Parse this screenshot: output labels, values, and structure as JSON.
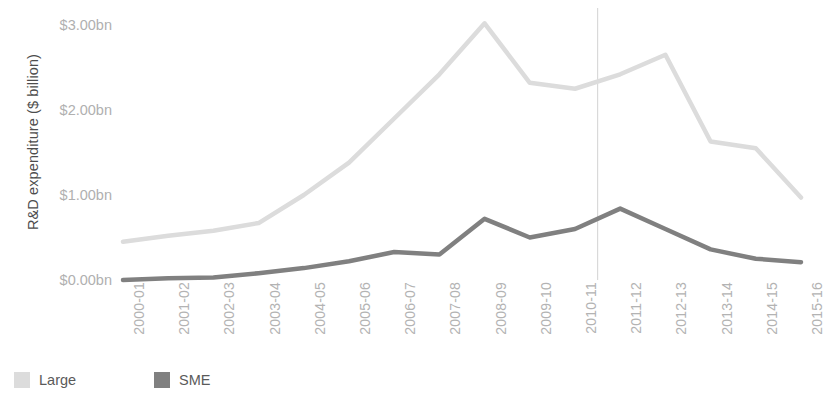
{
  "chart_data": {
    "type": "line",
    "title": "",
    "xlabel": "",
    "ylabel": "R&D expenditure ($ billion)",
    "categories": [
      "2000-01",
      "2001-02",
      "2002-03",
      "2003-04",
      "2004-05",
      "2005-06",
      "2006-07",
      "2007-08",
      "2008-09",
      "2009-10",
      "2010-11",
      "2011-12",
      "2012-13",
      "2013-14",
      "2014-15",
      "2015-16"
    ],
    "series": [
      {
        "name": "Large",
        "color": "#dcdcdc",
        "values": [
          0.45,
          0.52,
          0.58,
          0.67,
          1.0,
          1.38,
          1.9,
          2.42,
          3.02,
          2.32,
          2.25,
          2.42,
          2.65,
          1.63,
          1.55,
          0.97
        ]
      },
      {
        "name": "SME",
        "color": "#808080",
        "values": [
          0.0,
          0.02,
          0.03,
          0.08,
          0.14,
          0.22,
          0.33,
          0.3,
          0.72,
          0.5,
          0.6,
          0.84,
          0.6,
          0.36,
          0.25,
          0.21
        ]
      }
    ],
    "ylim": [
      0,
      3.2
    ],
    "yticks": [
      0,
      1,
      2,
      3
    ],
    "ytick_labels": [
      "$0.00bn",
      "$1.00bn",
      "$2.00bn",
      "$3.00bn"
    ],
    "grid": false,
    "legend_position": "bottom-left",
    "annotations": [
      {
        "type": "vertical-reference-line",
        "between": [
          "2010-11",
          "2011-12"
        ],
        "color": "#d9d9d9"
      }
    ]
  },
  "legend": {
    "items": [
      {
        "label": "Large",
        "color": "#dcdcdc"
      },
      {
        "label": "SME",
        "color": "#808080"
      }
    ]
  }
}
